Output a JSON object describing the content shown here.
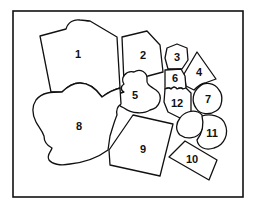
{
  "diagram": {
    "type": "numbered-region-map",
    "colors": {
      "stroke": "#111111",
      "fill": "#ffffff",
      "background": "#ffffff"
    },
    "regions": [
      {
        "id": 1,
        "label": "1"
      },
      {
        "id": 2,
        "label": "2"
      },
      {
        "id": 3,
        "label": "3"
      },
      {
        "id": 4,
        "label": "4"
      },
      {
        "id": 5,
        "label": "5"
      },
      {
        "id": 6,
        "label": "6"
      },
      {
        "id": 7,
        "label": "7"
      },
      {
        "id": 8,
        "label": "8"
      },
      {
        "id": 9,
        "label": "9"
      },
      {
        "id": 10,
        "label": "10"
      },
      {
        "id": 11,
        "label": "11"
      },
      {
        "id": 12,
        "label": "12"
      }
    ]
  }
}
